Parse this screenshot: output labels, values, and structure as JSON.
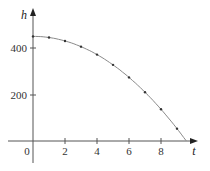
{
  "chart_data": {
    "type": "line",
    "title": "",
    "xlabel": "t",
    "ylabel": "h",
    "xlim": [
      -1.5,
      10.1
    ],
    "ylim": [
      -90,
      560
    ],
    "grid": false,
    "legend": null,
    "x_ticks": [
      0,
      2,
      4,
      6,
      8
    ],
    "x_tick_labels": [
      "0",
      "2",
      "4",
      "6",
      "8"
    ],
    "y_ticks": [
      200,
      400
    ],
    "y_tick_labels": [
      "200",
      "400"
    ],
    "series": [
      {
        "name": "h(t)",
        "style": "curve with dot markers",
        "x": [
          0,
          1,
          2,
          3,
          4,
          5,
          6,
          7,
          8,
          9
        ],
        "values": [
          450,
          445.1,
          430.4,
          405.9,
          371.6,
          327.5,
          273.6,
          209.9,
          136.4,
          53.1
        ],
        "curve_end": [
          9.58,
          0
        ]
      }
    ],
    "colors": {
      "axis": "#444444",
      "curve": "#888888",
      "markers": "#333333"
    }
  },
  "labels": {
    "origin": "0",
    "x_axis": "t",
    "y_axis": "h",
    "x_tick_2": "2",
    "x_tick_4": "4",
    "x_tick_6": "6",
    "x_tick_8": "8",
    "y_tick_200": "200",
    "y_tick_400": "400"
  }
}
